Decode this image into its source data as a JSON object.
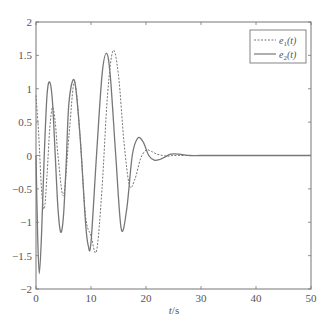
{
  "chart_data": {
    "type": "line",
    "title": "",
    "xlabel": "t/s",
    "ylabel": "",
    "xlim": [
      0,
      50
    ],
    "ylim": [
      -2,
      2
    ],
    "xticks": [
      0,
      10,
      20,
      30,
      40,
      50
    ],
    "yticks": [
      -2,
      -1.5,
      -1,
      -0.5,
      0,
      0.5,
      1,
      1.5,
      2
    ],
    "xtick_labels": [
      "0",
      "10",
      "20",
      "30",
      "40",
      "50"
    ],
    "ytick_labels": [
      "-2",
      "-1.5",
      "-1",
      "-0.5",
      "0",
      "0.5",
      "1",
      "1.5",
      "2"
    ],
    "grid": false,
    "legend_position": "upper right",
    "series": [
      {
        "name": "e1(t)",
        "style": "dashed",
        "x": [
          0,
          0.5,
          1,
          1.5,
          2,
          2.5,
          3,
          3.5,
          4,
          5,
          6,
          7,
          8,
          9,
          10,
          11,
          12,
          13,
          14,
          15,
          16,
          17,
          18,
          19,
          20,
          21,
          22,
          23,
          24,
          25,
          27,
          30,
          35,
          50
        ],
        "y": [
          0.9,
          0.3,
          -0.5,
          -0.8,
          -0.3,
          0.4,
          0.72,
          0.5,
          0.0,
          -0.6,
          0.3,
          1.1,
          0.3,
          -0.9,
          -1.2,
          -1.43,
          -0.5,
          0.9,
          1.57,
          1.2,
          0.2,
          -0.45,
          -0.35,
          -0.05,
          0.08,
          0.06,
          0.02,
          0.0,
          -0.01,
          0.0,
          0.0,
          0.0,
          0.0,
          0.0
        ]
      },
      {
        "name": "e2(t)",
        "style": "solid",
        "x": [
          0,
          0.3,
          0.6,
          1,
          1.5,
          2,
          2.5,
          3,
          3.5,
          4,
          4.5,
          5,
          5.5,
          6,
          7,
          8,
          9,
          9.5,
          10,
          11,
          12,
          12.8,
          13.5,
          14.5,
          15.5,
          16.5,
          17.5,
          18.5,
          19.5,
          20.5,
          21.5,
          22.5,
          23.5,
          24.5,
          26,
          28,
          30,
          35,
          50
        ],
        "y": [
          0.0,
          -1.2,
          -1.77,
          -1.2,
          0.0,
          0.9,
          1.1,
          0.8,
          0.0,
          -0.8,
          -1.15,
          -0.9,
          -0.1,
          0.8,
          1.12,
          0.3,
          -1.0,
          -1.35,
          -1.3,
          0.0,
          1.2,
          1.53,
          1.2,
          0.0,
          -1.1,
          -0.8,
          0.0,
          0.26,
          0.2,
          0.0,
          -0.07,
          -0.06,
          -0.02,
          0.02,
          0.02,
          0.0,
          0.0,
          0.0,
          0.0
        ]
      }
    ],
    "annotations": []
  },
  "legend": {
    "items": [
      {
        "label_main": "e",
        "label_sub": "1",
        "label_tail": "(t)"
      },
      {
        "label_main": "e",
        "label_sub": "2",
        "label_tail": "(t)"
      }
    ]
  },
  "axis_labels": {
    "x_main": "t",
    "x_tail": "/s"
  }
}
